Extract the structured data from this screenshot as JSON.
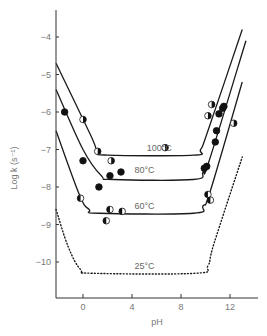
{
  "chart_data": {
    "type": "line",
    "title": "",
    "xlabel": "pH",
    "ylabel": "Log k (s⁻¹)",
    "xlim": [
      -2.2,
      14
    ],
    "ylim": [
      -11,
      -3.3
    ],
    "xticks": [
      0,
      4,
      8,
      12
    ],
    "xtick_labels": [
      "0",
      "4",
      "8",
      "12"
    ],
    "yticks": [
      -4,
      -5,
      -6,
      -7,
      -8,
      -9,
      -10
    ],
    "ytick_labels": [
      "−4",
      "−5",
      "−6",
      "−7",
      "−8",
      "−9",
      "−10"
    ],
    "grid": false,
    "legend": "none (curves labelled inline)",
    "series": [
      {
        "name": "100°C",
        "label": "100°C",
        "style": "solid",
        "marker": "half-filled circle (right half filled)",
        "curve": [
          [
            -2.2,
            -4.7
          ],
          [
            0.6,
            -6.6
          ],
          [
            1.2,
            -7.05
          ],
          [
            2,
            -7.15
          ],
          [
            9,
            -7.15
          ],
          [
            9.6,
            -7.0
          ],
          [
            10.2,
            -6.5
          ],
          [
            13,
            -3.8
          ]
        ],
        "points": [
          [
            0,
            -6.2
          ],
          [
            1.2,
            -7.05
          ],
          [
            2.3,
            -7.3
          ],
          [
            6.7,
            -6.95
          ],
          [
            10.5,
            -5.8
          ],
          [
            10.2,
            -6.1
          ],
          [
            12.3,
            -6.3
          ]
        ]
      },
      {
        "name": "80°C",
        "label": "80°C",
        "style": "solid",
        "marker": "filled circle",
        "curve": [
          [
            -2.2,
            -5.4
          ],
          [
            0,
            -7.0
          ],
          [
            1.5,
            -7.7
          ],
          [
            2.5,
            -7.8
          ],
          [
            9,
            -7.8
          ],
          [
            9.8,
            -7.6
          ],
          [
            10.3,
            -7.3
          ],
          [
            13.3,
            -4.1
          ]
        ],
        "points": [
          [
            -1.5,
            -6.0
          ],
          [
            0,
            -7.3
          ],
          [
            1.3,
            -8.0
          ],
          [
            2.2,
            -7.7
          ],
          [
            3.1,
            -7.6
          ],
          [
            9.9,
            -7.5
          ],
          [
            10.1,
            -7.45
          ],
          [
            10.8,
            -6.8
          ],
          [
            10.9,
            -6.5
          ],
          [
            11.1,
            -6.05
          ],
          [
            11.4,
            -5.9
          ],
          [
            11.5,
            -5.85
          ]
        ]
      },
      {
        "name": "60°C",
        "label": "60°C",
        "style": "solid",
        "marker": "half-filled circle (left half filled)",
        "curve": [
          [
            -2.2,
            -6.5
          ],
          [
            -0.3,
            -8.2
          ],
          [
            0.5,
            -8.6
          ],
          [
            1.3,
            -8.7
          ],
          [
            9,
            -8.7
          ],
          [
            9.8,
            -8.5
          ],
          [
            10.4,
            -8.1
          ],
          [
            13,
            -5.2
          ]
        ],
        "points": [
          [
            -0.2,
            -8.3
          ],
          [
            2.2,
            -8.6
          ],
          [
            3.2,
            -8.65
          ],
          [
            1.9,
            -8.9
          ],
          [
            10.2,
            -8.2
          ],
          [
            10.4,
            -8.35
          ]
        ]
      },
      {
        "name": "25°C",
        "label": "25°C",
        "style": "dotted",
        "marker": "none",
        "curve": [
          [
            -2.2,
            -8.6
          ],
          [
            -1.2,
            -9.6
          ],
          [
            -0.2,
            -10.2
          ],
          [
            0.8,
            -10.3
          ],
          [
            9.2,
            -10.3
          ],
          [
            10.2,
            -10.1
          ],
          [
            10.7,
            -9.5
          ],
          [
            13,
            -7.2
          ]
        ],
        "points": []
      }
    ],
    "annotations": [
      {
        "text": "100°C",
        "x": 5.2,
        "y": -6.95
      },
      {
        "text": "80°C",
        "x": 4.2,
        "y": -7.55
      },
      {
        "text": "60°C",
        "x": 4.2,
        "y": -8.5
      },
      {
        "text": "25°C",
        "x": 4.2,
        "y": -10.1
      }
    ]
  }
}
